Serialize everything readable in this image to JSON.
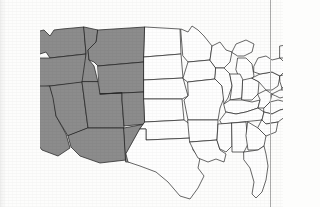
{
  "figure": {
    "type": "choropleth-map",
    "background_color": "#fdfdfc",
    "highlight_color": "#8c8c8c",
    "unhighlighted_color": "#fefefe",
    "outline_color": "#262626",
    "page_rule": {
      "name": "page-margin-rule",
      "color": "#a9a9a9",
      "x": 270,
      "orientation": "vertical"
    }
  },
  "legend": {
    "highlighted_label": "Shaded states",
    "unhighlighted_label": "Unshaded states",
    "highlighted_count": 11,
    "unhighlighted_count": 37
  },
  "chart_data": {
    "type": "map",
    "categories": [
      "highlighted",
      "unhighlighted"
    ],
    "highlighted_states": [
      "Washington",
      "Oregon",
      "California",
      "Nevada",
      "Idaho",
      "Montana",
      "Wyoming",
      "Utah",
      "Colorado",
      "Arizona",
      "New Mexico"
    ],
    "unhighlighted_states": [
      "North Dakota",
      "South Dakota",
      "Nebraska",
      "Kansas",
      "Oklahoma",
      "Texas",
      "Minnesota",
      "Iowa",
      "Missouri",
      "Arkansas",
      "Louisiana",
      "Wisconsin",
      "Illinois",
      "Michigan",
      "Indiana",
      "Ohio",
      "Kentucky",
      "Tennessee",
      "Mississippi",
      "Alabama",
      "West Virginia",
      "Virginia",
      "North Carolina",
      "South Carolina",
      "Georgia",
      "Florida",
      "Pennsylvania",
      "New York",
      "New Jersey",
      "Delaware",
      "Maryland",
      "Connecticut",
      "Rhode Island",
      "Massachusetts",
      "Vermont",
      "New Hampshire",
      "Maine"
    ],
    "values": [
      11,
      37
    ],
    "legend": "Shaded = western states"
  },
  "states": [
    {
      "code": "WA",
      "name": "Washington",
      "highlighted": true,
      "path": "M-14,18 L4,14 L10,20 L14,14 L22,13 L44,11 L46,38 L10,42 L6,36 L0,38 L-6,30 Z"
    },
    {
      "code": "OR",
      "name": "Oregon",
      "highlighted": true,
      "path": "M-16,42 L10,42 L46,38 L48,66 L10,70 L-10,72 L-18,62 Z"
    },
    {
      "code": "CA",
      "name": "California",
      "highlighted": true,
      "path": "M-18,70 L10,70 L14,84 L16,100 L26,118 L30,132 L18,140 L2,134 L-10,118 L-18,96 Z"
    },
    {
      "code": "NV",
      "name": "Nevada",
      "highlighted": true,
      "path": "M10,70 L42,66 L48,112 L28,120 L16,100 L13,82 Z"
    },
    {
      "code": "ID",
      "name": "Idaho",
      "highlighted": true,
      "path": "M44,11 L58,14 L56,26 L48,34 L49,44 L54,50 L58,66 L42,66 L46,38 Z"
    },
    {
      "code": "MT",
      "name": "Montana",
      "highlighted": true,
      "path": "M58,14 L105,11 L104,46 L58,50 L54,46 L49,44 L48,34 L56,26 Z"
    },
    {
      "code": "WY",
      "name": "Wyoming",
      "highlighted": true,
      "path": "M58,50 L104,46 L104,76 L60,78 Z"
    },
    {
      "code": "UT",
      "name": "Utah",
      "highlighted": true,
      "path": "M58,66 L60,78 L82,77 L82,84 L84,112 L48,112 L42,66 Z"
    },
    {
      "code": "CO",
      "name": "Colorado",
      "highlighted": true,
      "path": "M60,78 L104,76 L105,108 L84,110 L82,84 L82,77 Z"
    },
    {
      "code": "AZ",
      "name": "Arizona",
      "highlighted": true,
      "path": "M48,112 L84,112 L86,144 L60,147 L40,140 L31,131 L28,120 Z"
    },
    {
      "code": "NM",
      "name": "New Mexico",
      "highlighted": true,
      "path": "M84,112 L105,108 L106,136 L100,136 L100,146 L86,146 Z"
    },
    {
      "code": "ND",
      "name": "North Dakota",
      "highlighted": false,
      "path": "M105,11 L140,13 L141,38 L104,41 Z"
    },
    {
      "code": "SD",
      "name": "South Dakota",
      "highlighted": false,
      "path": "M104,41 L141,38 L143,62 L104,64 Z"
    },
    {
      "code": "NE",
      "name": "Nebraska",
      "highlighted": false,
      "path": "M104,64 L143,62 L148,80 L142,83 L104,83 Z"
    },
    {
      "code": "KS",
      "name": "Kansas",
      "highlighted": false,
      "path": "M104,83 L142,83 L144,104 L105,106 Z"
    },
    {
      "code": "OK",
      "name": "Oklahoma",
      "highlighted": false,
      "path": "M105,106 L144,104 L150,108 L152,122 L106,124 L106,113 L100,113 Z"
    },
    {
      "code": "TX",
      "name": "Texas",
      "highlighted": false,
      "path": "M100,113 L106,113 L106,124 L152,122 L153,134 L160,142 L158,152 L164,160 L158,172 L150,183 L140,180 L128,166 L116,156 L100,150 L88,146 L86,138 Z"
    },
    {
      "code": "MN",
      "name": "Minnesota",
      "highlighted": false,
      "path": "M141,13 L148,16 L152,10 L158,14 L164,20 L172,30 L170,44 L148,46 L143,40 Z"
    },
    {
      "code": "IA",
      "name": "Iowa",
      "highlighted": false,
      "path": "M143,62 L148,46 L170,44 L176,52 L175,63 L148,66 Z"
    },
    {
      "code": "MO",
      "name": "Missouri",
      "highlighted": false,
      "path": "M148,66 L175,63 L182,70 L184,82 L180,92 L178,104 L148,104 L144,84 L148,80 Z"
    },
    {
      "code": "AR",
      "name": "Arkansas",
      "highlighted": false,
      "path": "M148,104 L178,104 L177,124 L150,126 Z"
    },
    {
      "code": "LA",
      "name": "Louisiana",
      "highlighted": false,
      "path": "M150,126 L177,124 L180,134 L186,138 L184,146 L176,143 L168,146 L158,142 L153,133 Z"
    },
    {
      "code": "WI",
      "name": "Wisconsin",
      "highlighted": false,
      "path": "M170,44 L172,30 L180,26 L186,34 L192,36 L190,46 L184,52 L176,52 Z"
    },
    {
      "code": "IL",
      "name": "Illinois",
      "highlighted": false,
      "path": "M176,52 L184,52 L190,58 L192,70 L188,82 L184,88 L182,70 L175,63 Z"
    },
    {
      "code": "MI",
      "name": "Michigan",
      "highlighted": false,
      "path": "M192,36 L196,28 L206,24 L214,28 L212,36 L204,40 L198,40 Z M198,42 L206,42 L212,48 L214,60 L208,68 L200,64 L196,54 Z"
    },
    {
      "code": "IN",
      "name": "Indiana",
      "highlighted": false,
      "path": "M190,58 L200,58 L203,64 L202,82 L190,84 L192,70 Z"
    },
    {
      "code": "OH",
      "name": "Ohio",
      "highlighted": false,
      "path": "M203,64 L212,62 L219,66 L218,78 L212,84 L202,84 Z"
    },
    {
      "code": "KY",
      "name": "Kentucky",
      "highlighted": false,
      "path": "M184,88 L190,84 L202,84 L212,86 L220,84 L218,92 L206,96 L196,98 L186,96 Z"
    },
    {
      "code": "TN",
      "name": "Tennessee",
      "highlighted": false,
      "path": "M180,104 L186,96 L196,98 L206,96 L218,92 L224,96 L222,104 L182,108 Z"
    },
    {
      "code": "MS",
      "name": "Mississippi",
      "highlighted": false,
      "path": "M177,124 L178,108 L192,107 L192,130 L186,136 L180,133 Z"
    },
    {
      "code": "AL",
      "name": "Alabama",
      "highlighted": false,
      "path": "M192,107 L206,106 L208,128 L204,136 L192,136 L192,130 Z"
    },
    {
      "code": "WV",
      "name": "West Virginia",
      "highlighted": false,
      "path": "M218,78 L226,74 L232,78 L230,86 L224,92 L218,92 L220,84 Z"
    },
    {
      "code": "VA",
      "name": "Virginia",
      "highlighted": false,
      "path": "M224,92 L230,86 L238,84 L246,86 L248,92 L240,94 L232,98 L224,96 Z"
    },
    {
      "code": "NC",
      "name": "North Carolina",
      "highlighted": false,
      "path": "M222,104 L224,96 L232,98 L240,94 L248,92 L246,100 L238,106 L226,108 Z"
    },
    {
      "code": "SC",
      "name": "South Carolina",
      "highlighted": false,
      "path": "M222,104 L226,108 L238,106 L236,116 L226,120 L218,112 Z"
    },
    {
      "code": "GA",
      "name": "Georgia",
      "highlighted": false,
      "path": "M208,106 L218,112 L226,120 L224,130 L218,134 L208,134 L206,120 Z"
    },
    {
      "code": "FL",
      "name": "Florida",
      "highlighted": false,
      "path": "M204,136 L218,134 L224,130 L226,138 L228,150 L226,164 L222,176 L216,182 L212,178 L214,166 L210,152 L204,144 Z"
    },
    {
      "code": "PA",
      "name": "Pennsylvania",
      "highlighted": false,
      "path": "M212,62 L220,58 L232,56 L240,60 L238,70 L232,74 L226,74 L219,66 Z"
    },
    {
      "code": "NY",
      "name": "New York",
      "highlighted": false,
      "path": "M214,50 L218,42 L226,40 L232,44 L240,42 L246,48 L244,56 L240,60 L232,56 L220,58 L214,56 Z"
    },
    {
      "code": "NJ",
      "name": "New Jersey",
      "highlighted": false,
      "path": "M240,60 L246,58 L249,64 L247,72 L242,72 L240,66 Z"
    },
    {
      "code": "DE",
      "name": "Delaware",
      "highlighted": false,
      "path": "M242,72 L246,72 L247,79 L243,79 Z"
    },
    {
      "code": "MD",
      "name": "Maryland",
      "highlighted": false,
      "path": "M232,78 L240,74 L246,74 L247,80 L240,82 L236,80 Z"
    },
    {
      "code": "CT",
      "name": "Connecticut",
      "highlighted": false,
      "path": "M246,48 L252,48 L252,54 L246,55 Z"
    },
    {
      "code": "RI",
      "name": "Rhode Island",
      "highlighted": false,
      "path": "M252,48 L255,48 L255,53 L252,53 Z"
    },
    {
      "code": "MA",
      "name": "Massachusetts",
      "highlighted": false,
      "path": "M244,44 L254,43 L260,44 L262,48 L256,48 L252,47 L245,48 Z"
    },
    {
      "code": "VT",
      "name": "Vermont",
      "highlighted": false,
      "path": "M240,30 L246,29 L247,42 L240,42 Z"
    },
    {
      "code": "NH",
      "name": "New Hampshire",
      "highlighted": false,
      "path": "M247,29 L252,28 L254,42 L248,43 Z"
    },
    {
      "code": "ME",
      "name": "Maine",
      "highlighted": false,
      "path": "M252,28 L254,18 L260,14 L266,18 L268,28 L262,36 L258,42 L254,42 Z"
    }
  ]
}
